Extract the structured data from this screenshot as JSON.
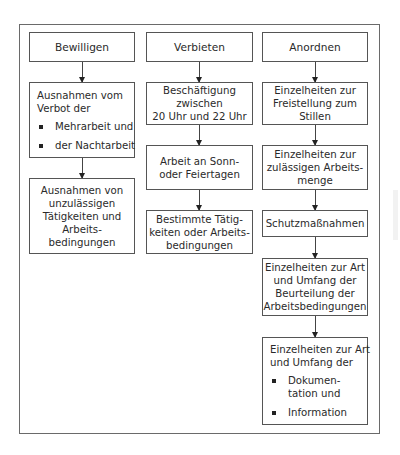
{
  "diagram": {
    "columns": [
      {
        "header": "Bewilligen",
        "boxes": [
          {
            "lines": [
              "Ausnahmen vom",
              "Verbot der"
            ],
            "bullets": [
              "Mehrarbeit und",
              "der Nachtarbeit"
            ]
          },
          {
            "lines": [
              "Ausnahmen von",
              "unzulässigen",
              "Tätigkeiten und",
              "Arbeits-",
              "bedingungen"
            ]
          }
        ]
      },
      {
        "header": "Verbieten",
        "boxes": [
          {
            "lines": [
              "Beschäftigung",
              "zwischen",
              "20 Uhr und 22 Uhr"
            ]
          },
          {
            "lines": [
              "Arbeit an Sonn-",
              "oder Feiertagen"
            ]
          },
          {
            "lines": [
              "Bestimmte Tätig-",
              "keiten oder Arbeits-",
              "bedingungen"
            ]
          }
        ]
      },
      {
        "header": "Anordnen",
        "boxes": [
          {
            "lines": [
              "Einzelheiten zur",
              "Freistellung zum",
              "Stillen"
            ]
          },
          {
            "lines": [
              "Einzelheiten zur",
              "zulässigen Arbeits-",
              "menge"
            ]
          },
          {
            "lines": [
              "Schutzmaßnahmen"
            ]
          },
          {
            "lines": [
              "Einzelheiten zur Art",
              "und Umfang der",
              "Beurteilung der",
              "Arbeitsbedingungen"
            ]
          },
          {
            "lines": [
              "Einzelheiten zur Art",
              "und Umfang der"
            ],
            "bullets": [
              "Dokumen-\ntation und",
              "Information"
            ]
          }
        ]
      }
    ]
  }
}
